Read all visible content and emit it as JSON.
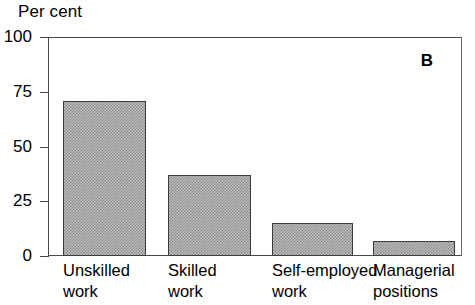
{
  "chart_data": {
    "type": "bar",
    "title": "",
    "panel_label": "B",
    "ylabel": "Per cent",
    "xlabel": "",
    "ylim": [
      0,
      100
    ],
    "yticks": [
      0,
      25,
      50,
      75,
      100
    ],
    "ytick_labels": [
      "0",
      "25",
      "50",
      "75",
      "100"
    ],
    "grid": false,
    "legend": false,
    "categories": [
      "Unskilled work",
      "Skilled work",
      "Self-employed work",
      "Managerial positions"
    ],
    "category_lines": [
      {
        "line1": "Unskilled",
        "line2": "work"
      },
      {
        "line1": "Skilled",
        "line2": "work"
      },
      {
        "line1": "Self-employed",
        "line2": "work"
      },
      {
        "line1": "Managerial",
        "line2": "positions"
      }
    ],
    "values": [
      71,
      37,
      15,
      7
    ],
    "bar_fill": "#b9b9b9",
    "bar_pattern": "checkerboard-dither",
    "bar_edge_color": "#3c3c3c",
    "axis_color": "#4a4a4a",
    "background": "#ffffff"
  }
}
